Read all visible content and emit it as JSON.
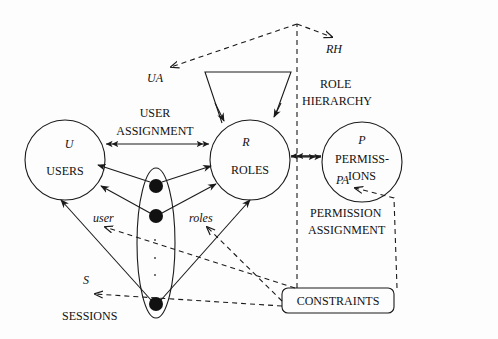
{
  "diagram": {
    "type": "RBAC model diagram",
    "nodes": {
      "users": {
        "symbol": "U",
        "label": "USERS"
      },
      "roles": {
        "symbol": "R",
        "label": "ROLES"
      },
      "permissions": {
        "symbol": "P",
        "label_line1": "PERMISS-",
        "label_line2": "IONS"
      },
      "sessions": {
        "symbol": "S",
        "label": "SESSIONS"
      },
      "constraints": {
        "label": "CONSTRAINTS"
      }
    },
    "relations": {
      "user_assignment": {
        "abbr": "UA",
        "line1": "USER",
        "line2": "ASSIGNMENT"
      },
      "role_hierarchy": {
        "abbr": "RH",
        "line1": "ROLE",
        "line2": "HIERARCHY"
      },
      "permission_assignment": {
        "abbr": "PA",
        "line1": "PERMISSION",
        "line2": "ASSIGNMENT"
      },
      "user_fn": "user",
      "roles_fn": "roles"
    },
    "ellipsis": "·"
  }
}
